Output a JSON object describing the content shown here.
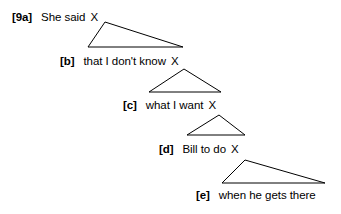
{
  "figure": {
    "stroke_color": "#000000",
    "background_color": "#ffffff",
    "placeholder_symbol": "X"
  },
  "lines": [
    {
      "tag": "[9a]",
      "text": "She said",
      "placeholder": "X",
      "has_placeholder": true
    },
    {
      "tag": "[b]",
      "text": "that I don't know",
      "placeholder": "X",
      "has_placeholder": true
    },
    {
      "tag": "[c]",
      "text": "what I want",
      "placeholder": "X",
      "has_placeholder": true
    },
    {
      "tag": "[d]",
      "text": "Bill to do",
      "placeholder": "X",
      "has_placeholder": true
    },
    {
      "tag": "[e]",
      "text": "when he gets there",
      "placeholder": "",
      "has_placeholder": false
    }
  ],
  "triangles": [
    {
      "name": "triangle-a-to-b",
      "apex_x": 105,
      "apex_y": 22,
      "left_x": 88,
      "left_y": 47,
      "right_x": 183,
      "right_y": 47
    },
    {
      "name": "triangle-b-to-c",
      "apex_x": 184,
      "apex_y": 69,
      "left_x": 149,
      "left_y": 92,
      "right_x": 221,
      "right_y": 92
    },
    {
      "name": "triangle-c-to-d",
      "apex_x": 219,
      "apex_y": 115,
      "left_x": 187,
      "left_y": 135,
      "right_x": 245,
      "right_y": 135
    },
    {
      "name": "triangle-d-to-e",
      "apex_x": 245,
      "apex_y": 160,
      "left_x": 222,
      "left_y": 183,
      "right_x": 325,
      "right_y": 183
    }
  ]
}
